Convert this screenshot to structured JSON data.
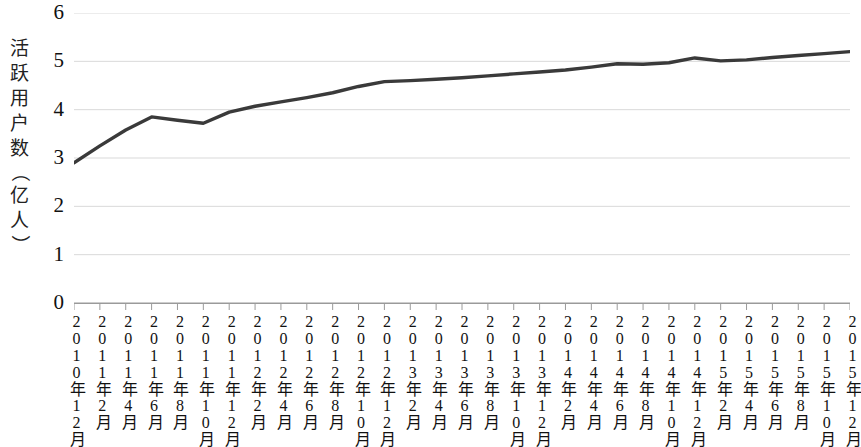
{
  "chart_data": {
    "type": "line",
    "title": "",
    "xlabel": "",
    "ylabel": "活跃用户数（亿人）",
    "ylim": [
      0,
      6
    ],
    "yticks": [
      0,
      1,
      2,
      3,
      4,
      5,
      6
    ],
    "ytick_labels": [
      "0",
      "1",
      "2",
      "3",
      "4",
      "5",
      "6"
    ],
    "grid": true,
    "legend": "none",
    "line_color": "#3a3a3a",
    "grid_color": "#d9d9d9",
    "axis_color": "#9a9a9a",
    "categories": [
      "2010年12月",
      "2011年2月",
      "2011年4月",
      "2011年6月",
      "2011年8月",
      "2011年10月",
      "2011年12月",
      "2012年2月",
      "2012年4月",
      "2012年6月",
      "2012年8月",
      "2012年10月",
      "2012年12月",
      "2013年2月",
      "2013年4月",
      "2013年6月",
      "2013年8月",
      "2013年10月",
      "2013年12月",
      "2014年2月",
      "2014年4月",
      "2014年6月",
      "2014年8月",
      "2014年10月",
      "2014年12月",
      "2015年2月",
      "2015年4月",
      "2015年6月",
      "2015年8月",
      "2015年10月",
      "2015年12月"
    ],
    "series": [
      {
        "name": "活跃用户数",
        "values": [
          2.9,
          3.25,
          3.58,
          3.85,
          3.78,
          3.72,
          3.95,
          4.07,
          4.16,
          4.25,
          4.35,
          4.48,
          4.58,
          4.6,
          4.63,
          4.66,
          4.7,
          4.74,
          4.78,
          4.82,
          4.88,
          4.95,
          4.94,
          4.97,
          5.07,
          5.01,
          5.03,
          5.08,
          5.12,
          5.16,
          5.2
        ]
      }
    ]
  },
  "y_axis_title_chars": [
    "活",
    "跃",
    "用",
    "户",
    "数",
    "（",
    "亿",
    "人",
    "）"
  ]
}
